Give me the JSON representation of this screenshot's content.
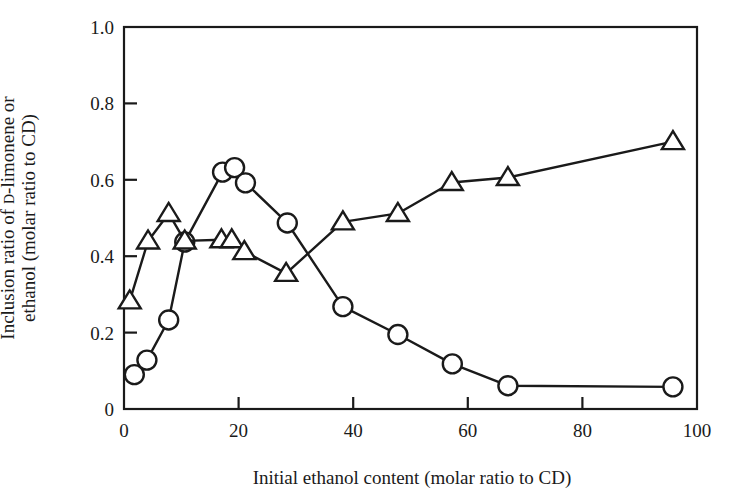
{
  "chart_data": {
    "type": "line",
    "title": "",
    "xlabel": "Initial ethanol content  (molar ratio to CD)",
    "ylabel_line1": "Inclusion ratio of D-limonene or",
    "ylabel_line2": "ethanol (molar ratio to CD)",
    "ylabel_smallcaps_part": "D",
    "xlim": [
      0,
      100
    ],
    "ylim": [
      0,
      1.0
    ],
    "xticks": [
      0,
      20,
      40,
      60,
      80,
      100
    ],
    "xtick_labels": [
      "0",
      "20",
      "40",
      "60",
      "80",
      "100"
    ],
    "yticks": [
      0,
      0.2,
      0.4,
      0.6,
      0.8,
      1.0
    ],
    "ytick_labels": [
      "0",
      "0.2",
      "0.4",
      "0.6",
      "0.8",
      "1.0"
    ],
    "grid": false,
    "legend": "none",
    "marker_color": "#ffffff",
    "line_color": "#1a1a1a",
    "series": [
      {
        "name": "D-limonene",
        "marker": "circle",
        "points": [
          [
            1.8,
            0.09
          ],
          [
            4.0,
            0.128
          ],
          [
            7.8,
            0.233
          ],
          [
            10.6,
            0.437
          ],
          [
            17.2,
            0.62
          ],
          [
            19.3,
            0.632
          ],
          [
            21.2,
            0.592
          ],
          [
            28.5,
            0.487
          ],
          [
            38.2,
            0.268
          ],
          [
            47.8,
            0.195
          ],
          [
            57.3,
            0.118
          ],
          [
            67.0,
            0.061
          ],
          [
            95.8,
            0.058
          ]
        ]
      },
      {
        "name": "ethanol",
        "marker": "triangle",
        "points": [
          [
            1.0,
            0.283
          ],
          [
            4.2,
            0.44
          ],
          [
            7.8,
            0.512
          ],
          [
            10.6,
            0.44
          ],
          [
            17.0,
            0.443
          ],
          [
            18.8,
            0.443
          ],
          [
            21.0,
            0.412
          ],
          [
            28.3,
            0.355
          ],
          [
            38.2,
            0.49
          ],
          [
            47.8,
            0.512
          ],
          [
            57.2,
            0.593
          ],
          [
            67.0,
            0.606
          ],
          [
            95.8,
            0.7
          ]
        ]
      }
    ]
  }
}
